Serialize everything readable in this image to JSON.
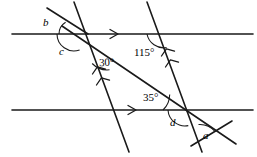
{
  "figure": {
    "stroke_color": "#1a1a1a",
    "background_color": "#ffffff",
    "width": 257,
    "height": 157
  },
  "labels": {
    "b": {
      "text": "b",
      "x": 43,
      "y": 17,
      "kind": "variable"
    },
    "c": {
      "text": "c",
      "x": 59,
      "y": 46,
      "kind": "variable"
    },
    "angle30": {
      "text": "30°",
      "x": 99,
      "y": 57,
      "kind": "measure"
    },
    "angle115": {
      "text": "115°",
      "x": 134,
      "y": 47,
      "kind": "measure"
    },
    "angle35": {
      "text": "35°",
      "x": 143,
      "y": 92,
      "kind": "measure"
    },
    "d": {
      "text": "d",
      "x": 170,
      "y": 117,
      "kind": "variable"
    },
    "a": {
      "text": "a",
      "x": 203,
      "y": 130,
      "kind": "variable"
    }
  },
  "lines": {
    "parallel_top": {
      "name": "top-parallel-line",
      "x1": 12,
      "y1": 34,
      "x2": 253,
      "y2": 34,
      "marker": "single-arrow"
    },
    "parallel_bottom": {
      "name": "bottom-parallel-line",
      "x1": 12,
      "y1": 110,
      "x2": 253,
      "y2": 110,
      "marker": "single-arrow"
    },
    "transversal_left": {
      "name": "left-transversal",
      "x1": 74,
      "y1": 2,
      "x2": 129,
      "y2": 152,
      "marker": "double-arrow"
    },
    "transversal_right": {
      "name": "right-transversal",
      "x1": 147,
      "y1": 2,
      "x2": 202,
      "y2": 152,
      "marker": "double-arrow"
    },
    "diagonal_main": {
      "name": "main-diagonal-transversal",
      "x1": 62,
      "y1": 26,
      "x2": 236,
      "y2": 144,
      "marker": "none"
    },
    "ray_b": {
      "name": "ray-forming-angle-b",
      "x1": 47,
      "y1": 8,
      "x2": 88,
      "y2": 34
    },
    "ray_a": {
      "name": "ray-forming-angle-a",
      "x1": 191,
      "y1": 146,
      "x2": 232,
      "y2": 121
    }
  },
  "arcs": {
    "arc_b": {
      "name": "angle-arc-b"
    },
    "arc_c": {
      "name": "angle-arc-c"
    },
    "arc_30": {
      "name": "angle-arc-30"
    },
    "arc_115": {
      "name": "angle-arc-115"
    },
    "arc_35": {
      "name": "angle-arc-35"
    },
    "arc_d": {
      "name": "angle-arc-d"
    },
    "arc_a": {
      "name": "angle-arc-a"
    }
  }
}
